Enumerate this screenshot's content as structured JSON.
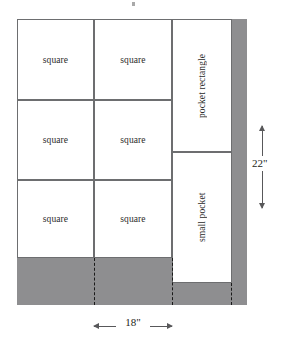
{
  "diagram": {
    "colors": {
      "waste_gray": "#8e8e90",
      "piece_white": "#ffffff",
      "outline": "#58585a",
      "piece_border": "#6d6e70",
      "dash": "#1a1a1a",
      "text": "#231f20"
    },
    "pieces": {
      "squares": [
        {
          "label": "square",
          "row": 1,
          "col": 1
        },
        {
          "label": "square",
          "row": 1,
          "col": 2
        },
        {
          "label": "square",
          "row": 2,
          "col": 1
        },
        {
          "label": "square",
          "row": 2,
          "col": 2
        },
        {
          "label": "square",
          "row": 3,
          "col": 1
        },
        {
          "label": "square",
          "row": 3,
          "col": 2
        }
      ],
      "pocket_rectangle": {
        "label": "pocket rectangle"
      },
      "small_pocket": {
        "label": "small pocket"
      }
    },
    "dimensions": {
      "width": {
        "value": "18\"",
        "orientation": "horizontal"
      },
      "height": {
        "value": "22\"",
        "orientation": "vertical"
      }
    }
  }
}
